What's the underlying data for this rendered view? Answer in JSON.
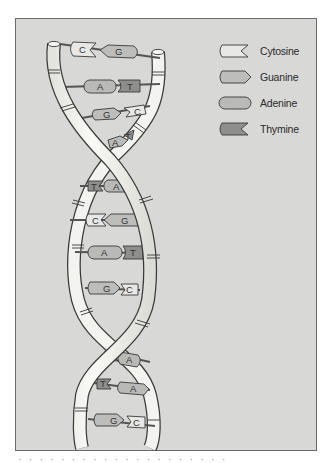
{
  "diagram": {
    "legend": [
      {
        "name": "Cytosine",
        "letter": "C",
        "shape": "notched-left",
        "color": "#e8e8e6"
      },
      {
        "name": "Guanine",
        "letter": "G",
        "shape": "arrow-right",
        "color": "#bdbdbb"
      },
      {
        "name": "Adenine",
        "letter": "A",
        "shape": "rounded",
        "color": "#b9b9b7"
      },
      {
        "name": "Thymine",
        "letter": "T",
        "shape": "notched-left",
        "color": "#8e8e8c"
      }
    ],
    "base_pairs": [
      {
        "left": "C",
        "right": "G"
      },
      {
        "left": "A",
        "right": "T"
      },
      {
        "left": "G",
        "right": "C"
      },
      {
        "left": "A",
        "right": "T"
      },
      {
        "left": "T",
        "right": "A"
      },
      {
        "left": "C",
        "right": "G"
      },
      {
        "left": "A",
        "right": "T"
      },
      {
        "left": "G",
        "right": "C"
      },
      {
        "left": "T",
        "right": "A"
      },
      {
        "left": "T",
        "right": "A"
      },
      {
        "left": "G",
        "right": "C"
      }
    ],
    "colors": {
      "panel_background": "#d8d8d6",
      "backbone": "#f3f3ef",
      "outline": "#3a3a3a",
      "cytosine": "#e8e8e6",
      "guanine": "#bdbdbb",
      "adenine": "#b9b9b7",
      "thymine": "#8e8e8c"
    }
  },
  "caption": "· · · · · · · · · · · · · · · · · · · ·"
}
